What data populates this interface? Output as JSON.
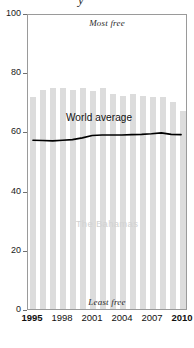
{
  "chart_data": {
    "type": "bar",
    "title": "",
    "xlabel": "",
    "ylabel": "",
    "ylim": [
      0,
      100
    ],
    "xlim": [
      1995,
      2010
    ],
    "grid": false,
    "legend_position": "inline-annotations",
    "categories": [
      1995,
      1996,
      1997,
      1998,
      1999,
      2000,
      2001,
      2002,
      2003,
      2004,
      2005,
      2006,
      2007,
      2008,
      2009,
      2010
    ],
    "series": [
      {
        "name": "The Bahamas",
        "type": "bar",
        "color": "#dcdcdc",
        "values": [
          71.5,
          74.0,
          74.5,
          74.5,
          74.0,
          74.5,
          73.5,
          74.5,
          72.5,
          72.0,
          72.5,
          72.0,
          71.5,
          71.5,
          70.0,
          67.0
        ]
      },
      {
        "name": "World average",
        "type": "line",
        "color": "#000000",
        "values": [
          57.4,
          57.3,
          57.2,
          57.4,
          57.6,
          58.2,
          59.0,
          59.2,
          59.2,
          59.2,
          59.3,
          59.4,
          59.6,
          59.9,
          59.4,
          59.3
        ]
      }
    ],
    "y_ticks": [
      0,
      20,
      40,
      60,
      80,
      100
    ],
    "x_ticks": [
      1995,
      1998,
      2001,
      2004,
      2007,
      2010
    ],
    "x_tick_labels": [
      "1995",
      "1998",
      "2001",
      "2004",
      "2007",
      "2010"
    ],
    "x_tick_emphasis": [
      true,
      false,
      false,
      false,
      false,
      true
    ],
    "annotations": [
      {
        "name": "most-free",
        "text": "Most free",
        "position": "top-center"
      },
      {
        "name": "least-free",
        "text": "Least free",
        "position": "bottom-center"
      },
      {
        "name": "series-name",
        "text": "The Bahamas",
        "position": "center"
      },
      {
        "name": "world-average",
        "text": "World average",
        "position": "mid-left"
      }
    ]
  },
  "axis": {
    "y_labels": [
      "100",
      "80",
      "60",
      "40",
      "20",
      "0"
    ],
    "y_values": [
      100,
      80,
      60,
      40,
      20,
      0
    ]
  },
  "annotations": {
    "most_free": "Most free",
    "least_free": "Least free",
    "series_name": "The Bahamas",
    "world_average": "World average"
  },
  "title_artifact": "y",
  "colors": {
    "bar": "#dcdcdc",
    "line": "#000000",
    "frame": "#9a9a9a",
    "series_label": "#d2d2d2",
    "background": "#ffffff"
  }
}
